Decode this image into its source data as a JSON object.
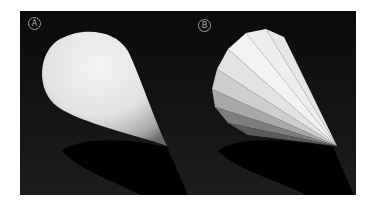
{
  "figure": {
    "panels": [
      {
        "label": "A",
        "description": "smooth shaded cone"
      },
      {
        "label": "B",
        "description": "faceted (flat shaded) cone"
      }
    ],
    "colors": {
      "background": "#0b0b0b",
      "cone_light": "#f2f2f2",
      "cone_mid": "#c8c8c8",
      "cone_dark": "#6e6e6e",
      "shadow": "#000000",
      "label": "#a8a8a8"
    }
  }
}
